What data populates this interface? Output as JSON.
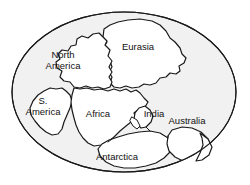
{
  "figure": {
    "name": "pangaea-supercontinent-map",
    "type": "diagram",
    "projection": "oval",
    "ocean_color": "#f1f1f1",
    "land_color": "#ffffff",
    "outline_color": "#1a1a1a",
    "background_color": "#ffffff"
  },
  "labels": [
    {
      "id": "eurasia",
      "text": "Eurasia",
      "x": 138,
      "y": 48,
      "lines": 1
    },
    {
      "id": "north-america",
      "text": "North\nAmerica",
      "x": 63,
      "y": 61,
      "lines": 2
    },
    {
      "id": "south-america",
      "text": "S.\nAmerica",
      "x": 43,
      "y": 107,
      "lines": 2
    },
    {
      "id": "africa",
      "text": "Africa",
      "x": 98,
      "y": 114,
      "lines": 1
    },
    {
      "id": "india",
      "text": "India",
      "x": 154,
      "y": 114,
      "lines": 1
    },
    {
      "id": "australia",
      "text": "Australia",
      "x": 187,
      "y": 121,
      "lines": 1
    },
    {
      "id": "antarctica",
      "text": "Antarctica",
      "x": 116,
      "y": 157,
      "lines": 1
    }
  ]
}
